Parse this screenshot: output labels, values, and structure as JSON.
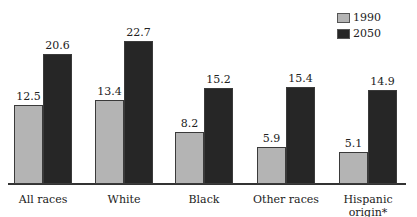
{
  "chart_data": {
    "type": "bar",
    "title": "",
    "xlabel": "",
    "ylabel": "",
    "categories": [
      "All races",
      "White",
      "Black",
      "Other races",
      "Hispanic origin*"
    ],
    "series": [
      {
        "name": "1990",
        "values": [
          12.5,
          13.4,
          8.2,
          5.9,
          5.1
        ],
        "color": "#b4b4b4"
      },
      {
        "name": "2050",
        "values": [
          20.6,
          22.7,
          15.2,
          15.4,
          14.9
        ],
        "color": "#262626"
      }
    ],
    "value_labels": {
      "1990": [
        "12.5",
        "13.4",
        "8.2",
        "5.9",
        "5.1"
      ],
      "2050": [
        "20.6",
        "22.7",
        "15.2",
        "15.4",
        "14.9"
      ]
    },
    "ylim": [
      0,
      23
    ],
    "grid": false,
    "y_axis_visible": false,
    "legend": {
      "position": "top-right",
      "entries": [
        "1990",
        "2050"
      ]
    }
  },
  "legend": {
    "items": [
      {
        "label": "1990",
        "color": "#b4b4b4"
      },
      {
        "label": "2050",
        "color": "#262626"
      }
    ]
  }
}
